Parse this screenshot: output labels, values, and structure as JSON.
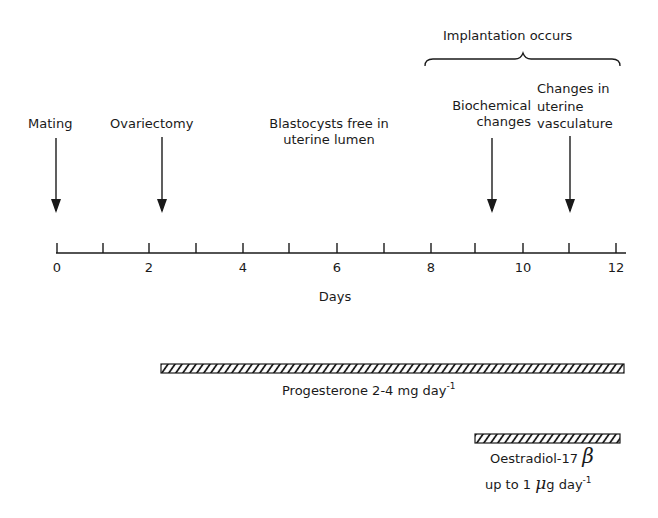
{
  "diagram": {
    "header": {
      "bracket_label": "Implantation occurs"
    },
    "events": [
      {
        "id": "mating",
        "label_lines": [
          "Mating"
        ],
        "day": 0
      },
      {
        "id": "ovariectomy",
        "label_lines": [
          "Ovariectomy"
        ],
        "day": 2.25
      },
      {
        "id": "blastocysts",
        "label_lines": [
          "Blastocysts free in",
          "uterine lumen"
        ],
        "day": null
      },
      {
        "id": "biochemical",
        "label_lines": [
          "Biochemical",
          "changes"
        ],
        "day": 9.4
      },
      {
        "id": "vasculature",
        "label_lines": [
          "Changes in",
          "uterine",
          "vasculature"
        ],
        "day": 11
      }
    ],
    "axis": {
      "label": "Days",
      "min": 0,
      "max": 12,
      "tick_step": 1,
      "tick_labels": [
        "0",
        "2",
        "4",
        "6",
        "8",
        "10",
        "12"
      ]
    },
    "treatments": [
      {
        "id": "progesterone",
        "label": "Progesterone 2-4 mg day",
        "label_sup": "-1",
        "start_day": 2.25,
        "end_day": 12.2
      },
      {
        "id": "oestradiol",
        "label_line1": "Oestradiol-17",
        "label_greek": "β",
        "label_line2_pre": "up to 1 ",
        "label_line2_mu": "μ",
        "label_line2_post": "g day",
        "label_sup": "-1",
        "start_day": 9.1,
        "end_day": 12.1
      }
    ],
    "colors": {
      "ink": "#1a1a1a",
      "background": "#ffffff"
    }
  }
}
